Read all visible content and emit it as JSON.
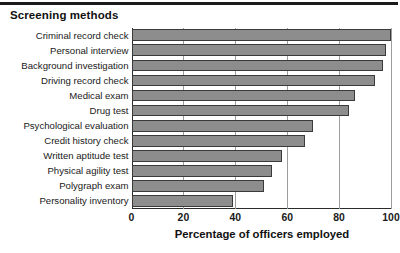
{
  "figure": {
    "title": "Screening methods",
    "has_top_rule": true
  },
  "chart_data": {
    "type": "bar",
    "orientation": "horizontal",
    "title": "Screening methods",
    "xlabel": "Percentage of officers employed",
    "ylabel": "",
    "xlim": [
      0,
      100
    ],
    "xticks": [
      0,
      20,
      40,
      60,
      80,
      100
    ],
    "xtick_labels": [
      "0",
      "20",
      "40",
      "60",
      "80",
      "100"
    ],
    "grid": "vertical",
    "legend": "none",
    "bar_color": "#8d8d8d",
    "bar_edge_color": "#3a3a3a",
    "categories": [
      "Criminal record check",
      "Personal interview",
      "Background investigation",
      "Driving record check",
      "Medical exam",
      "Drug test",
      "Psychological evaluation",
      "Credit history check",
      "Written aptitude test",
      "Physical agility test",
      "Polygraph exam",
      "Personality inventory"
    ],
    "values": [
      100,
      98,
      97,
      94,
      86,
      84,
      70,
      67,
      58,
      54,
      51,
      39
    ]
  }
}
